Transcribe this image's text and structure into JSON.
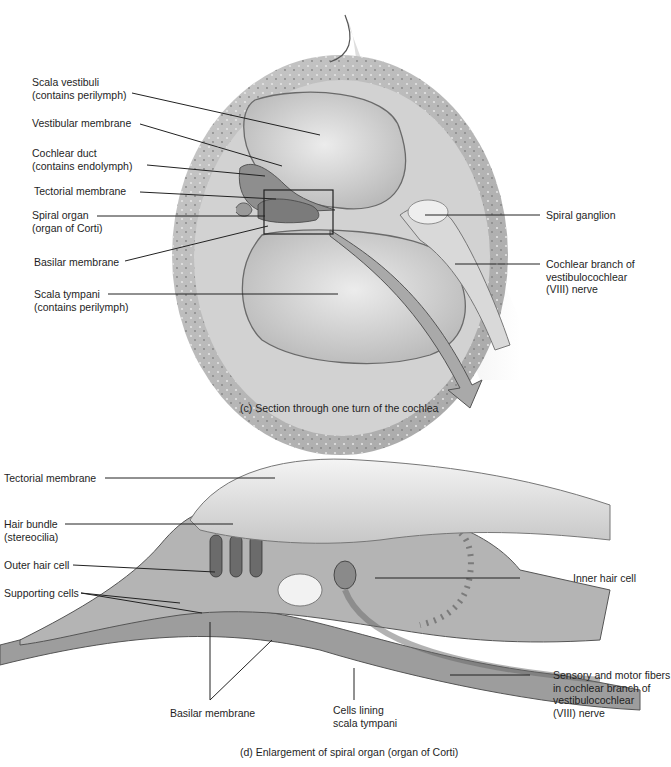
{
  "panel_c": {
    "caption": "(c) Section through one turn of the cochlea",
    "labels": [
      {
        "id": "scala-vestibuli",
        "text": "Scala vestibuli\n(contains perilymph)"
      },
      {
        "id": "vestibular-membrane",
        "text": "Vestibular membrane"
      },
      {
        "id": "cochlear-duct",
        "text": "Cochlear duct\n(contains endolymph)"
      },
      {
        "id": "tectorial-membrane",
        "text": "Tectorial membrane"
      },
      {
        "id": "spiral-organ",
        "text": "Spiral organ\n(organ of Corti)"
      },
      {
        "id": "basilar-membrane",
        "text": "Basilar membrane"
      },
      {
        "id": "scala-tympani",
        "text": "Scala tympani\n(contains perilymph)"
      },
      {
        "id": "spiral-ganglion",
        "text": "Spiral ganglion"
      },
      {
        "id": "cochlear-branch",
        "text": "Cochlear branch of\nvestibulocochlear\n(VIII) nerve"
      }
    ]
  },
  "panel_d": {
    "caption": "(d) Enlargement of spiral organ (organ of Corti)",
    "labels": [
      {
        "id": "tectorial-membrane",
        "text": "Tectorial membrane"
      },
      {
        "id": "hair-bundle",
        "text": "Hair bundle\n(stereocilia)"
      },
      {
        "id": "outer-hair-cell",
        "text": "Outer hair cell"
      },
      {
        "id": "supporting-cells",
        "text": "Supporting cells"
      },
      {
        "id": "inner-hair-cell",
        "text": "Inner hair cell"
      },
      {
        "id": "sensory-motor-fibers",
        "text": "Sensory and motor fibers\nin cochlear branch of\nvestibulocochlear\n(VIII) nerve"
      },
      {
        "id": "basilar-membrane",
        "text": "Basilar membrane"
      },
      {
        "id": "cells-lining",
        "text": "Cells lining\nscala tympani"
      }
    ]
  }
}
